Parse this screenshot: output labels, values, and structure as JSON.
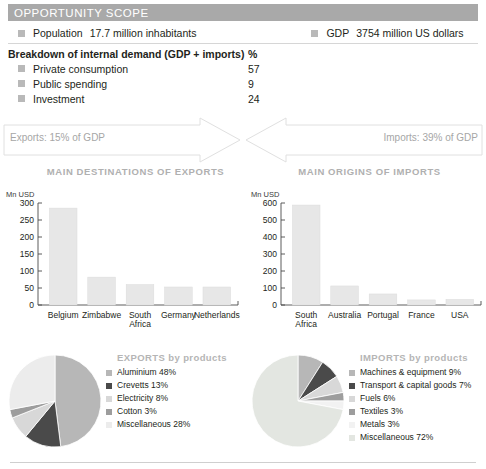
{
  "header": {
    "title": "OPPORTUNITY SCOPE",
    "bar_color": "#a9a9a9"
  },
  "facts": [
    {
      "label": "Population",
      "value": "17.7 million inhabitants",
      "icon": "square-bullet"
    },
    {
      "label": "GDP",
      "value": "3754 million US dollars",
      "icon": "square-bullet"
    }
  ],
  "breakdown": {
    "heading": "Breakdown of internal demand (GDP + imports)",
    "unit_header": "%",
    "rows": [
      {
        "label": "Private consumption",
        "value": "57"
      },
      {
        "label": "Public spending",
        "value": "9"
      },
      {
        "label": "Investment",
        "value": "24"
      }
    ]
  },
  "flow": {
    "exports_label": "Exports: 15% of GDP",
    "imports_label": "Imports: 39% of GDP"
  },
  "charts": {
    "exports_title": "MAIN DESTINATIONS OF EXPORTS",
    "imports_title": "MAIN ORIGINS OF IMPORTS"
  },
  "pies": {
    "exports_legend_title": "EXPORTS by products",
    "imports_legend_title": "IMPORTS by products"
  },
  "chart_data": [
    {
      "type": "bar",
      "title": "MAIN DESTINATIONS OF EXPORTS",
      "categories": [
        "Belgium",
        "Zimbabwe",
        "South Africa",
        "Germany",
        "Netherlands"
      ],
      "values": [
        285,
        82,
        60,
        53,
        53
      ],
      "xlabel": "",
      "ylabel": "Mn USD",
      "ylim": [
        0,
        300
      ],
      "yticks": [
        0,
        50,
        100,
        150,
        200,
        250,
        300
      ],
      "grid": false,
      "legend": "none",
      "bar_color": "#e7e7e7"
    },
    {
      "type": "bar",
      "title": "MAIN ORIGINS OF IMPORTS",
      "categories": [
        "South Africa",
        "Australia",
        "Portugal",
        "France",
        "USA"
      ],
      "values": [
        588,
        112,
        65,
        30,
        33
      ],
      "xlabel": "",
      "ylabel": "Mn USD",
      "ylim": [
        0,
        600
      ],
      "yticks": [
        0,
        100,
        200,
        300,
        400,
        500,
        600
      ],
      "grid": false,
      "legend": "none",
      "bar_color": "#e7e7e7"
    },
    {
      "type": "pie",
      "title": "EXPORTS by products",
      "categories": [
        "Aluminium",
        "Crevetts",
        "Electricity",
        "Cotton",
        "Miscellaneous"
      ],
      "values": [
        48,
        13,
        8,
        3,
        28
      ],
      "labels": [
        "Aluminium 48%",
        "Crevetts 13%",
        "Electricity 8%",
        "Cotton 3%",
        "Miscellaneous 28%"
      ],
      "colors": [
        "#b7b7b7",
        "#4a4a4a",
        "#d8d8d8",
        "#9d9d9d",
        "#ececec"
      ],
      "legend": "right"
    },
    {
      "type": "pie",
      "title": "IMPORTS by products",
      "categories": [
        "Machines & equipment",
        "Transport & capital goods",
        "Fuels",
        "Textiles",
        "Metals",
        "Miscellaneous"
      ],
      "values": [
        9,
        7,
        6,
        3,
        3,
        72
      ],
      "labels": [
        "Machines & equipment 9%",
        "Transport & capital goods 7%",
        "Fuels 6%",
        "Textiles 3%",
        "Metals 3%",
        "Miscellaneous 72%"
      ],
      "colors": [
        "#b7b7b7",
        "#4a4a4a",
        "#d8d8d8",
        "#9d9d9d",
        "#f2f2f2",
        "#e3e6e1"
      ],
      "legend": "right"
    }
  ]
}
